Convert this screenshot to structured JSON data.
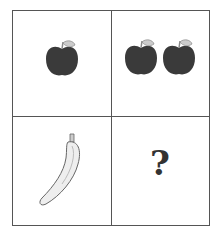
{
  "puzzle": {
    "cells": [
      {
        "position": "top-left",
        "content": "apple",
        "count": 1
      },
      {
        "position": "top-right",
        "content": "apple",
        "count": 2
      },
      {
        "position": "bottom-left",
        "content": "banana",
        "count": 1
      },
      {
        "position": "bottom-right",
        "content": "question-mark",
        "symbol": "?"
      }
    ],
    "colors": {
      "apple": "#3a3a3a",
      "stem": "#bbbbbb",
      "banana": "#e8e8e8",
      "line": "#555555"
    }
  }
}
